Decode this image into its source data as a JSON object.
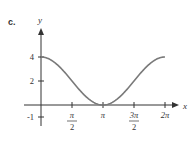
{
  "panel_label": "c.",
  "chart_data": {
    "type": "line",
    "title": "",
    "function": "y = 2 + 2cos(x)",
    "xlabel": "x",
    "ylabel": "y",
    "xlim": [
      0,
      6.2832
    ],
    "ylim": [
      -1,
      4
    ],
    "x_ticks": [
      {
        "value": 1.5708,
        "label_num": "π",
        "label_den": "2"
      },
      {
        "value": 3.1416,
        "label_num": "π",
        "label_den": ""
      },
      {
        "value": 4.7124,
        "label_num": "3π",
        "label_den": "2"
      },
      {
        "value": 6.2832,
        "label_num": "2π",
        "label_den": ""
      }
    ],
    "y_ticks": [
      {
        "value": 4,
        "label": "4"
      },
      {
        "value": 2,
        "label": "2"
      },
      {
        "value": -1,
        "label": "-1"
      }
    ],
    "series": [
      {
        "name": "y = 2 + 2cos(x)",
        "color": "#7a7a7a",
        "x": [
          0,
          0.7854,
          1.5708,
          2.3562,
          3.1416,
          3.927,
          4.7124,
          5.4978,
          6.2832
        ],
        "y": [
          4,
          3.41,
          2,
          0.59,
          0,
          0.59,
          2,
          3.41,
          4
        ]
      }
    ],
    "grid": false,
    "legend": "none"
  },
  "colors": {
    "axis": "#333333",
    "curve": "#7a7a7a"
  }
}
